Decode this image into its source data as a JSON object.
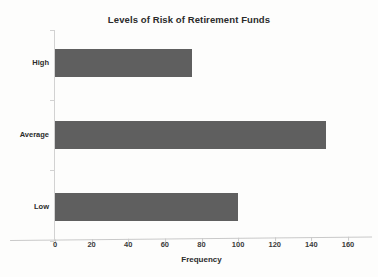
{
  "scan": {
    "top_fragment_text": ""
  },
  "chart_data": {
    "type": "bar",
    "orientation": "horizontal",
    "title": "Levels of Risk of Retirement Funds",
    "xlabel": "Frequency",
    "ylabel": "",
    "categories": [
      "High",
      "Average",
      "Low"
    ],
    "values": [
      75,
      148,
      100
    ],
    "xlim": [
      0,
      160
    ],
    "xticks": [
      0,
      20,
      40,
      60,
      80,
      100,
      120,
      140,
      160
    ],
    "xtick_labels": [
      "0",
      "20",
      "40",
      "60",
      "80",
      "100",
      "120",
      "140",
      "160"
    ],
    "grid": false,
    "legend": null,
    "bar_color": "#5f5f5f",
    "axis_color": "#c9c9c9",
    "background": "#fdfdfc"
  }
}
